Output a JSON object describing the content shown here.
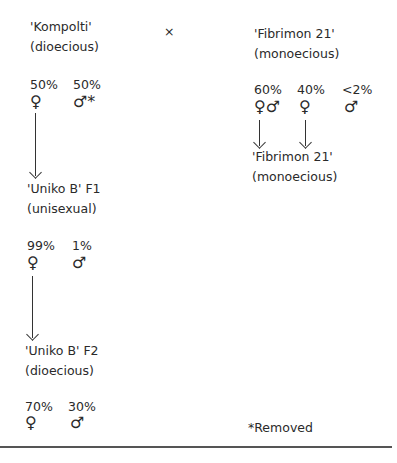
{
  "diagram": {
    "parents": {
      "left": {
        "name": "'Kompolti'",
        "type": "(dioecious)",
        "percents": [
          "50%",
          "50%"
        ],
        "symbols": [
          "♀",
          "♂*"
        ]
      },
      "cross": "×",
      "right": {
        "name": "'Fibrimon 21'",
        "type": "(monoecious)",
        "percents": [
          "60%",
          "40%",
          "<2%"
        ],
        "symbols": [
          "♀♂",
          "♀",
          "♂"
        ]
      }
    },
    "f1": {
      "name": "'Uniko B' F1",
      "type": "(unisexual)",
      "percents": [
        "99%",
        "1%"
      ],
      "symbols": [
        "♀",
        "♂"
      ]
    },
    "f2": {
      "name": "'Uniko B' F2",
      "type": "(dioecious)",
      "percents": [
        "70%",
        "30%"
      ],
      "symbols": [
        "♀",
        "♂"
      ]
    },
    "right_offspring": {
      "name": "'Fibrimon 21'",
      "type": "(monoecious)"
    },
    "footnote": "*Removed"
  }
}
